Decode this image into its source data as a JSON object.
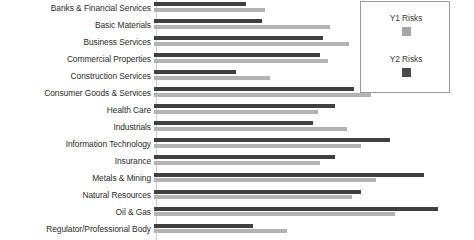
{
  "chart_data": {
    "type": "bar",
    "orientation": "horizontal",
    "title": "",
    "subtitle": "",
    "xlabel": "",
    "ylabel": "",
    "grid": false,
    "legend_position": "top-right",
    "xlim": [
      0,
      100
    ],
    "categories": [
      "Banks & Financial Services",
      "Basic Materials",
      "Business Services",
      "Commercial Properties",
      "Construction Services",
      "Consumer Goods & Services",
      "Health Care",
      "Industrials",
      "Information Technology",
      "Insurance",
      "Metals & Mining",
      "Natural Resources",
      "Oil & Gas",
      "Regulator/Professional Body"
    ],
    "series": [
      {
        "name": "Y1 Risks",
        "color": "#b3b3b3",
        "values": [
          46,
          73,
          81,
          72,
          48,
          90,
          68,
          80,
          86,
          69,
          92,
          82,
          100,
          55
        ]
      },
      {
        "name": "Y2 Risks",
        "color": "#404040",
        "values": [
          38,
          45,
          70,
          69,
          34,
          83,
          75,
          66,
          98,
          75,
          112,
          86,
          118,
          41
        ]
      }
    ],
    "annotations": [],
    "note": "Bottom category label is partially cropped by the figure edge."
  },
  "legend": {
    "entries": [
      {
        "label": "Y1 Risks",
        "swatch_color": "#a6a6a6"
      },
      {
        "label": "Y2 Risks",
        "swatch_color": "#4a4a4a"
      }
    ]
  }
}
